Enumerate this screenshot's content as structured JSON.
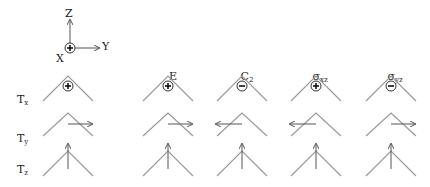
{
  "axes": {
    "z_label": "Z",
    "y_label": "Y",
    "x_label": "X",
    "x_symbol": "⊕"
  },
  "columns": [
    {
      "label": "E",
      "sub": ""
    },
    {
      "label": "C",
      "sub": "2"
    },
    {
      "label": "σ",
      "sub": "xz"
    },
    {
      "label": "σ",
      "sub": "yz"
    }
  ],
  "rows": [
    {
      "label": "T",
      "sub": "x",
      "cells": [
        "+",
        "+",
        "-",
        "+",
        "-"
      ]
    },
    {
      "label": "T",
      "sub": "y",
      "cells": [
        "right",
        "right",
        "left",
        "left",
        "right"
      ]
    },
    {
      "label": "T",
      "sub": "z",
      "cells": [
        "up",
        "up",
        "up",
        "up",
        "up"
      ]
    }
  ]
}
